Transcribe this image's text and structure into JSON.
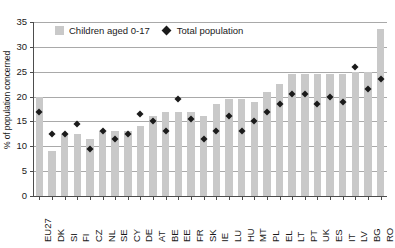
{
  "chart_data": {
    "type": "bar",
    "title": "",
    "xlabel": "",
    "ylabel": "% of population concerned",
    "ylim": [
      0,
      35
    ],
    "ytick_step": 5,
    "yticks": [
      0,
      5,
      10,
      15,
      20,
      25,
      30,
      35
    ],
    "grid": true,
    "legend_position": "top-left-inside",
    "bar_color": "#c9c9c9",
    "marker_color": "#1b1b1b",
    "categories": [
      "EU27",
      "DK",
      "SI",
      "FI",
      "CZ",
      "NL",
      "SE",
      "CY",
      "DE",
      "AT",
      "BE",
      "EE",
      "FR",
      "SK",
      "IE",
      "LU",
      "HU",
      "MT",
      "PL",
      "EL",
      "LT",
      "PT",
      "UK",
      "ES",
      "IT",
      "LV",
      "BG",
      "RO"
    ],
    "series": [
      {
        "name": "Children aged 0-17",
        "render": "bar",
        "values": [
          20.0,
          9.0,
          12.5,
          12.5,
          11.5,
          13.0,
          13.0,
          13.0,
          14.0,
          16.0,
          17.0,
          17.0,
          17.0,
          16.0,
          18.5,
          19.5,
          19.5,
          19.0,
          21.0,
          22.5,
          24.5,
          24.5,
          24.5,
          24.5,
          24.5,
          25.0,
          25.0,
          33.5
        ]
      },
      {
        "name": "Total population",
        "render": "diamond",
        "values": [
          17.0,
          12.5,
          12.5,
          14.5,
          9.5,
          13.0,
          11.5,
          12.5,
          16.5,
          15.0,
          13.0,
          19.5,
          15.5,
          11.5,
          13.0,
          16.0,
          13.0,
          15.0,
          17.0,
          18.5,
          20.5,
          20.5,
          18.5,
          20.0,
          19.0,
          26.0,
          21.5,
          23.5
        ]
      }
    ]
  }
}
